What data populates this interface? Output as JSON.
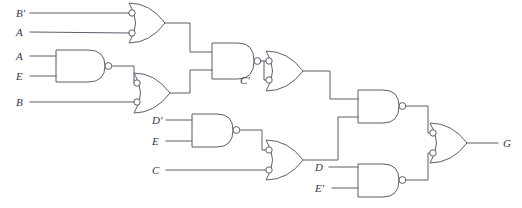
{
  "diagram": {
    "type": "combinational-logic-circuit",
    "stroke_color": "#5a5f6b",
    "label_color": "#2e3650",
    "background": "#ffffff"
  },
  "inputs": [
    {
      "id": "in-b-not",
      "label": "B'",
      "x": 16,
      "y": 17,
      "wire_y": 13
    },
    {
      "id": "in-a-1",
      "label": "A",
      "x": 16,
      "y": 36,
      "wire_y": 32
    },
    {
      "id": "in-a-2",
      "label": "A",
      "x": 16,
      "y": 60,
      "wire_y": 56
    },
    {
      "id": "in-e-1",
      "label": "E",
      "x": 16,
      "y": 80,
      "wire_y": 76
    },
    {
      "id": "in-b",
      "label": "B",
      "x": 16,
      "y": 106,
      "wire_y": 102
    },
    {
      "id": "in-d-not",
      "label": "D'",
      "x": 152,
      "y": 124,
      "wire_y": 120
    },
    {
      "id": "in-e-2",
      "label": "E",
      "x": 152,
      "y": 145,
      "wire_y": 141
    },
    {
      "id": "in-c",
      "label": "C",
      "x": 152,
      "y": 174,
      "wire_y": 170
    },
    {
      "id": "in-d",
      "label": "D",
      "x": 318,
      "y": 171,
      "wire_y": 167
    },
    {
      "id": "in-e-not",
      "label": "E'",
      "x": 318,
      "y": 192,
      "wire_y": 188
    }
  ],
  "internal_labels": [
    {
      "id": "net-c-not",
      "label": "C'",
      "x": 240,
      "y": 84
    }
  ],
  "outputs": [
    {
      "id": "out-g",
      "label": "G",
      "x": 505,
      "y": 147,
      "wire_y": 143
    }
  ],
  "gates": [
    {
      "id": "gate-1",
      "kind": "or-inverted-inputs",
      "inputs": [
        "B'",
        "A"
      ],
      "output_net": "n1"
    },
    {
      "id": "gate-2",
      "kind": "nand",
      "inputs": [
        "A",
        "E"
      ],
      "output_net": "n2"
    },
    {
      "id": "gate-3",
      "kind": "or-inverted-inputs",
      "inputs": [
        "n2",
        "B"
      ],
      "output_net": "n3"
    },
    {
      "id": "gate-4",
      "kind": "nand",
      "inputs": [
        "n1",
        "n3"
      ],
      "output_net": "C'"
    },
    {
      "id": "gate-5",
      "kind": "or-inverted-inputs",
      "inputs": [
        "C'",
        "C'"
      ],
      "output_net": "n5"
    },
    {
      "id": "gate-6",
      "kind": "nand",
      "inputs": [
        "D'",
        "E"
      ],
      "output_net": "n6"
    },
    {
      "id": "gate-7",
      "kind": "or-inverted-inputs",
      "inputs": [
        "n6",
        "C"
      ],
      "output_net": "D"
    },
    {
      "id": "gate-8",
      "kind": "nand",
      "inputs": [
        "n5",
        "D"
      ],
      "output_net": "n8"
    },
    {
      "id": "gate-9",
      "kind": "nand",
      "inputs": [
        "D",
        "E'"
      ],
      "output_net": "n9"
    },
    {
      "id": "gate-10",
      "kind": "or-inverted-inputs",
      "inputs": [
        "n8",
        "n9"
      ],
      "output_net": "G"
    }
  ]
}
